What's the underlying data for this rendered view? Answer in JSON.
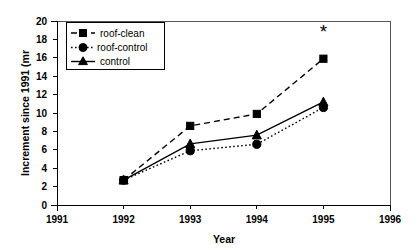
{
  "chart_data": {
    "type": "line",
    "title": "",
    "xlabel": "Year",
    "ylabel": "Increment since 1991 (mr",
    "x": [
      1992,
      1993,
      1994,
      1995
    ],
    "xlim": [
      1991,
      1996
    ],
    "ylim": [
      0,
      20
    ],
    "xticks": [
      "1991",
      "1992",
      "1993",
      "1994",
      "1995",
      "1996"
    ],
    "yticks": [
      "0",
      "2",
      "4",
      "6",
      "8",
      "10",
      "12",
      "14",
      "16",
      "18",
      "20"
    ],
    "grid": false,
    "legend_position": "top-left",
    "series": [
      {
        "name": "roof-clean",
        "marker": "square",
        "linestyle": "dashed",
        "color": "#000000",
        "values": [
          2.7,
          8.6,
          9.9,
          15.9
        ]
      },
      {
        "name": "roof-control",
        "marker": "circle",
        "linestyle": "dotted",
        "color": "#000000",
        "values": [
          2.7,
          5.9,
          6.6,
          10.6
        ]
      },
      {
        "name": "control",
        "marker": "triangle",
        "linestyle": "solid",
        "color": "#000000",
        "values": [
          2.7,
          6.65,
          7.6,
          11.2
        ]
      }
    ],
    "annotations": [
      {
        "text": "*",
        "x": 1995,
        "y": 18.1,
        "name": "significance-asterisk"
      }
    ]
  },
  "axes": {
    "y_tick_labels": [
      "20",
      "18",
      "16",
      "14",
      "12",
      "10",
      "8",
      "6",
      "4",
      "2",
      "0"
    ],
    "x_tick_labels": [
      "1991",
      "1992",
      "1993",
      "1994",
      "1995",
      "1996"
    ],
    "x_axis_title": "Year",
    "y_axis_title": "Increment since 1991 (mr"
  },
  "legend": {
    "entries": [
      {
        "label": "roof-clean"
      },
      {
        "label": "roof-control"
      },
      {
        "label": "control"
      }
    ]
  }
}
